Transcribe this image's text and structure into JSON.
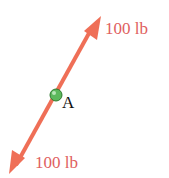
{
  "diagram": {
    "title": "",
    "forces": [
      {
        "label": "100 lb",
        "direction": "up-right"
      },
      {
        "label": "100 lb",
        "direction": "down-left"
      }
    ],
    "point": {
      "label": "A"
    },
    "colors": {
      "arrow": "#ef6f57",
      "label": "#e06060",
      "point": "#5cb85c",
      "point_label": "#111111"
    }
  }
}
